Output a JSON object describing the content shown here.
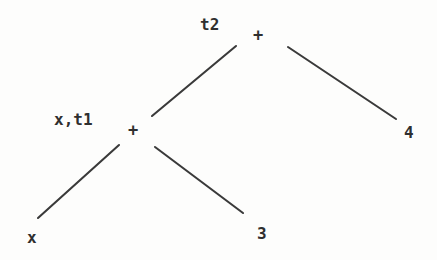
{
  "diagram": {
    "type": "binary-expression-tree",
    "background_color": "#fdfdfc",
    "edge_color": "#3a3a3a",
    "text_color": "#2f2f2f",
    "nodes": [
      {
        "id": "root",
        "operator": "+",
        "label": "t2",
        "x": 259,
        "y": 36,
        "label_x": 200,
        "label_y": 17
      },
      {
        "id": "inner",
        "operator": "+",
        "label": "x,t1",
        "x": 134,
        "y": 131,
        "label_x": 54,
        "label_y": 112
      }
    ],
    "leaves": [
      {
        "id": "leaf-x",
        "value": "x",
        "x": 27,
        "y": 230
      },
      {
        "id": "leaf-3",
        "value": "3",
        "x": 257,
        "y": 226
      },
      {
        "id": "leaf-4",
        "value": "4",
        "x": 404,
        "y": 125
      }
    ],
    "edges": [
      {
        "id": "root-left",
        "from": "root",
        "to": "inner",
        "x1": 236,
        "y1": 46,
        "x2": 152,
        "y2": 116
      },
      {
        "id": "root-right",
        "from": "root",
        "to": "leaf-4",
        "x1": 288,
        "y1": 47,
        "x2": 396,
        "y2": 119
      },
      {
        "id": "inner-left",
        "from": "inner",
        "to": "leaf-x",
        "x1": 119,
        "y1": 145,
        "x2": 38,
        "y2": 218
      },
      {
        "id": "inner-right",
        "from": "inner",
        "to": "leaf-3",
        "x1": 155,
        "y1": 147,
        "x2": 243,
        "y2": 213
      }
    ]
  }
}
